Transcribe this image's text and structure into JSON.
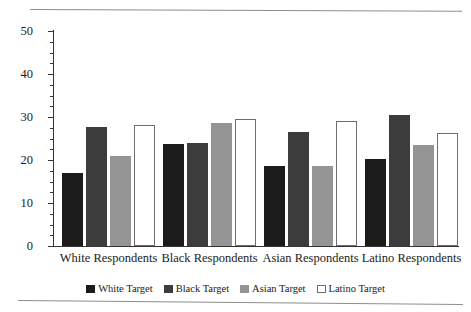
{
  "chart_data": {
    "type": "bar",
    "title": "",
    "subtitle": "",
    "xlabel": "",
    "ylabel": "",
    "ylim": [
      0,
      50
    ],
    "ytick_labels": [
      "0",
      "10",
      "20",
      "30",
      "40",
      "50"
    ],
    "ytick_values": [
      0,
      10,
      20,
      30,
      40,
      50
    ],
    "yminor_step": 2.5,
    "grid": false,
    "legend_position": "bottom",
    "categories": [
      "White Respondents",
      "Black Respondents",
      "Asian Respondents",
      "Latino Respondents"
    ],
    "series": [
      {
        "name": "White Target",
        "color": "#1b1b1b",
        "values": [
          17.0,
          23.8,
          18.5,
          20.3
        ]
      },
      {
        "name": "Black Target",
        "color": "#3c3c3c",
        "values": [
          27.6,
          24.0,
          26.5,
          30.5
        ]
      },
      {
        "name": "Asian Target",
        "color": "#949494",
        "values": [
          20.9,
          28.5,
          18.5,
          23.4
        ]
      },
      {
        "name": "Latino Target",
        "color": "#ffffff",
        "values": [
          28.2,
          29.6,
          29.0,
          26.3
        ]
      }
    ]
  },
  "axis": {
    "y_ticks": [
      {
        "label": "50",
        "value": 50
      },
      {
        "label": "40",
        "value": 40
      },
      {
        "label": "30",
        "value": 30
      },
      {
        "label": "20",
        "value": 20
      },
      {
        "label": "10",
        "value": 10
      },
      {
        "label": "0",
        "value": 0
      }
    ]
  },
  "legend": {
    "items": [
      {
        "label": "White Target",
        "swatch": "s0"
      },
      {
        "label": "Black Target",
        "swatch": "s1"
      },
      {
        "label": "Asian Target",
        "swatch": "s2"
      },
      {
        "label": "Latino Target",
        "swatch": "s3"
      }
    ]
  }
}
